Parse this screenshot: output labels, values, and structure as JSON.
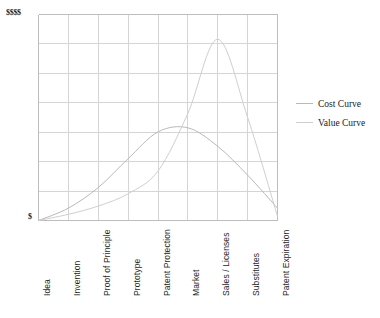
{
  "chart_data": {
    "type": "line",
    "title": "",
    "xlabel": "",
    "ylabel": "",
    "grid": true,
    "legend_position": "right",
    "y_axis": {
      "top_label": "$$$$",
      "bottom_label": "$",
      "ticks": [
        "$",
        "$$$$"
      ],
      "gridline_count": 6,
      "ylim": [
        0,
        100
      ]
    },
    "categories": [
      "Idea",
      "Invention",
      "Proof of Principle",
      "Prototype",
      "Patent Protection",
      "Market",
      "Sales / Licenses",
      "Substitutes",
      "Patent Expiration"
    ],
    "series": [
      {
        "name": "Cost Curve",
        "color": "#b9b9b9",
        "values": [
          0,
          6,
          16,
          30,
          43,
          45,
          36,
          22,
          6
        ]
      },
      {
        "name": "Value Curve",
        "color": "#cfcfcf",
        "values": [
          0,
          3,
          7,
          13,
          24,
          52,
          88,
          50,
          2
        ]
      }
    ],
    "legend": [
      {
        "label": "Cost Curve",
        "color": "#b9b9b9"
      },
      {
        "label": "Value Curve",
        "color": "#cfcfcf"
      }
    ],
    "colors": {
      "grid": "#d5d5d5",
      "axis": "#bdbdbd",
      "background": "#ffffff",
      "text": "#1a1a1a"
    }
  }
}
